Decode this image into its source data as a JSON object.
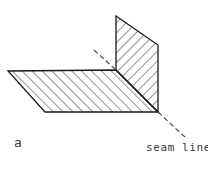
{
  "figure": {
    "panel_label": "a",
    "annotations": [
      {
        "name": "seam-line",
        "text": "seam line"
      }
    ],
    "colors": {
      "background": "#ffffff",
      "outline": "#1a1a1a",
      "hatch": "#2b2b2b",
      "dashed_leader": "#4a4a4a",
      "text": "#3a3a3a"
    },
    "geometry": {
      "horizontal_plane": {
        "name": "horizontal-flange",
        "points": "8,71 116,70 158,112 45,112",
        "hatch_direction": "up-right"
      },
      "vertical_plane": {
        "name": "vertical-flange",
        "points": "116,16 158,45 158,112 116,70",
        "hatch_direction": "down-right"
      },
      "seam_leader": {
        "name": "seam-leader-line",
        "segments": [
          {
            "x1": 94,
            "y1": 50,
            "x2": 116,
            "y2": 70
          },
          {
            "x1": 158,
            "y1": 112,
            "x2": 186,
            "y2": 138
          }
        ],
        "dash": "5 3"
      }
    }
  }
}
